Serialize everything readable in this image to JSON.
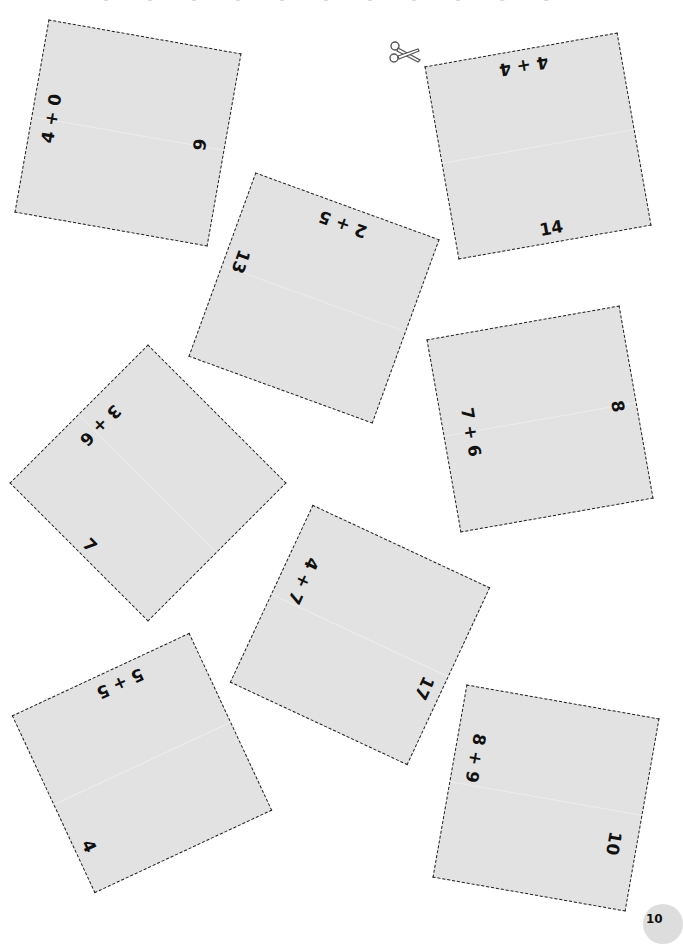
{
  "page": {
    "title_partial": "· · · · · · · · · · ·",
    "page_number": "10",
    "background_color": "#ffffff",
    "card_color": "#e2e2e2",
    "border_color": "#222222"
  },
  "scissors": {
    "icon": "scissors-icon",
    "glyph": "✂"
  },
  "cards": [
    {
      "id": 1,
      "problem": "4 + 0",
      "answer": "9"
    },
    {
      "id": 2,
      "problem": "4 + 4",
      "answer": "14"
    },
    {
      "id": 3,
      "problem": "2 + 5",
      "answer": "13"
    },
    {
      "id": 4,
      "problem": "7 + 6",
      "answer": "8"
    },
    {
      "id": 5,
      "problem": "3 + 6",
      "answer": "7"
    },
    {
      "id": 6,
      "problem": "4 + 7",
      "answer": "17"
    },
    {
      "id": 7,
      "problem": "5 + 5",
      "answer": "4"
    },
    {
      "id": 8,
      "problem": "8 + 9",
      "answer": "10"
    }
  ]
}
